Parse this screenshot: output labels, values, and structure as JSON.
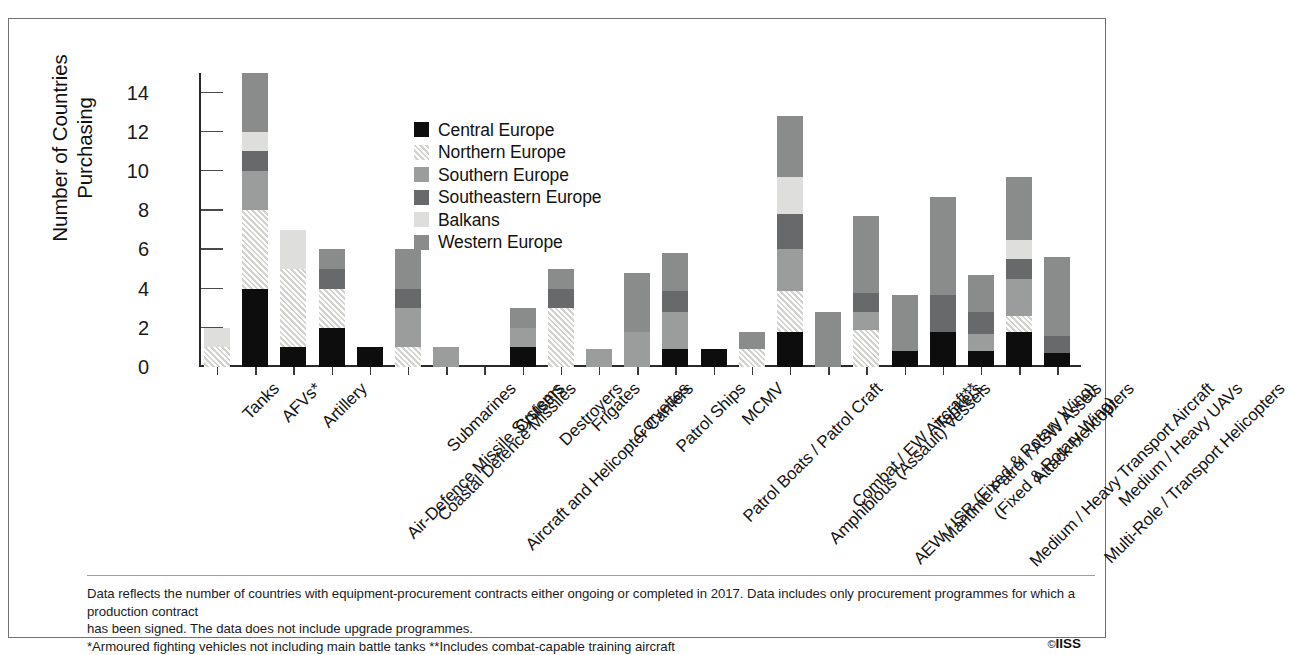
{
  "chart_data": {
    "type": "bar",
    "stacked": true,
    "title": "",
    "xlabel": "",
    "ylabel": "Number of Countries Purchasing",
    "ylim": [
      0,
      15
    ],
    "yticks": [
      0,
      2,
      4,
      6,
      8,
      10,
      12,
      14
    ],
    "grid": false,
    "legend_position": "inside-top-center",
    "categories": [
      "Tanks",
      "AFVs*",
      "Artillery",
      "Air-Defence Missile Systems",
      "Coastal Defence Missiles",
      "Submarines",
      "Aircraft and Helicopter Carriers",
      "Cruisers",
      "Destroyers",
      "Frigates",
      "Corvettes",
      "Patrol Ships",
      "Patrol Boats / Patrol Craft",
      "MCMV",
      "Amphibious (Assault) Vessels",
      "Combat / EW Aircraft**",
      "AEW / ISR (Fixed & Rotary Wing)",
      "Maritime Patrol / ASW Assets\n(Fixed & Rotary Wing)",
      "Tankers",
      "Medium / Heavy Transport Aircraft",
      "Attack Helicopters",
      "Multi-Role / Transport Helicopters",
      "Medium / Heavy UAVs"
    ],
    "series": [
      {
        "name": "Central Europe",
        "color": "#0d0d0d",
        "values": [
          0,
          4,
          1,
          2,
          1,
          0,
          0,
          0,
          1,
          0,
          0,
          0,
          0.9,
          0.9,
          0,
          1.8,
          0,
          0,
          0.8,
          1.8,
          0.8,
          1.8,
          0.7
        ]
      },
      {
        "name": "Northern Europe",
        "color": "#e3e3e1",
        "values": [
          1,
          4,
          4,
          2,
          0,
          1,
          0,
          0,
          0,
          3,
          0,
          0,
          0,
          0,
          0.9,
          2.1,
          0,
          1.9,
          0,
          0,
          0,
          0.8,
          0
        ]
      },
      {
        "name": "Southern Europe",
        "color": "#9b9c9c",
        "values": [
          0,
          2,
          0,
          0,
          0,
          2,
          1,
          0,
          1,
          0,
          0.9,
          1.8,
          1.9,
          0,
          0,
          2.1,
          0,
          0.9,
          0,
          0,
          0.9,
          1.9,
          0
        ]
      },
      {
        "name": "Southeastern Europe",
        "color": "#67696a",
        "values": [
          0,
          1,
          0,
          1,
          0,
          1,
          0,
          0,
          0,
          1,
          0,
          0,
          1.1,
          0,
          0,
          1.8,
          0,
          1.0,
          0,
          1.9,
          1.1,
          1.0,
          0.9
        ]
      },
      {
        "name": "Balkans",
        "color": "#dedfdd",
        "values": [
          1,
          1,
          2,
          0,
          0,
          0,
          0,
          0,
          0,
          0,
          0,
          0,
          0,
          0,
          0,
          1.9,
          0,
          0,
          0,
          0,
          0,
          1.0,
          0
        ]
      },
      {
        "name": "Western Europe",
        "color": "#8a8c8c",
        "values": [
          0,
          3,
          0,
          1,
          0,
          2,
          0,
          0,
          1,
          1,
          0,
          3,
          1.9,
          0,
          0.9,
          3.1,
          2.8,
          3.9,
          2.9,
          5.0,
          1.9,
          3.2,
          4.0
        ]
      }
    ],
    "totals": [
      2,
      15,
      7,
      6,
      1,
      6,
      1,
      0,
      3,
      5,
      0.9,
      4.8,
      7.8,
      0.9,
      1.8,
      12.8,
      2.8,
      7.7,
      3.7,
      8.7,
      4.7,
      9.7,
      5.6
    ]
  },
  "legend": {
    "entries": [
      {
        "label": "Central Europe",
        "color": "#0d0d0d",
        "style": "solid"
      },
      {
        "label": "Northern Europe",
        "color": "#e3e3e1",
        "style": "hatch"
      },
      {
        "label": "Southern Europe",
        "color": "#9b9c9c",
        "style": "solid"
      },
      {
        "label": "Southeastern Europe",
        "color": "#67696a",
        "style": "solid"
      },
      {
        "label": "Balkans",
        "color": "#dedfdd",
        "style": "solid"
      },
      {
        "label": "Western Europe",
        "color": "#8a8c8c",
        "style": "solid"
      }
    ]
  },
  "footnotes": {
    "line1": "Data reflects the number of countries with equipment-procurement contracts either ongoing or completed in 2017. Data includes only procurement programmes for which a production contract",
    "line2": "has been signed. The data does not include upgrade programmes.",
    "line3": "*Armoured fighting vehicles not including main battle tanks  **Includes combat-capable training aircraft"
  },
  "credit": {
    "mark": "©",
    "text": "IISS"
  }
}
